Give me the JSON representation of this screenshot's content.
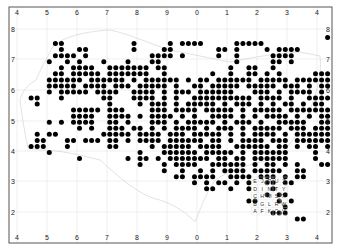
{
  "map": {
    "frame": {
      "x": 9,
      "y": 7,
      "w": 323,
      "h": 236,
      "stroke": "#555555"
    },
    "grid_color": "#dddddd",
    "coast_color": "#bbbbbb",
    "dot_color": "#000000",
    "x_ticks": [
      {
        "label": "4",
        "x": 17
      },
      {
        "label": "5",
        "x": 47
      },
      {
        "label": "6",
        "x": 77
      },
      {
        "label": "7",
        "x": 107
      },
      {
        "label": "8",
        "x": 137
      },
      {
        "label": "9",
        "x": 167
      },
      {
        "label": "0",
        "x": 197
      },
      {
        "label": "1",
        "x": 227
      },
      {
        "label": "2",
        "x": 257
      },
      {
        "label": "3",
        "x": 287
      },
      {
        "label": "4",
        "x": 317
      }
    ],
    "y_ticks": [
      {
        "label": "8",
        "y": 29
      },
      {
        "label": "7",
        "y": 59
      },
      {
        "label": "6",
        "y": 90
      },
      {
        "label": "5",
        "y": 121
      },
      {
        "label": "4",
        "y": 151
      },
      {
        "label": "3",
        "y": 181
      },
      {
        "label": "2",
        "y": 212
      }
    ],
    "dot_grid": {
      "x0": 13,
      "dx": 6.05,
      "y0": 31.5,
      "dy": 6.05,
      "r": 2.5,
      "rows": [
        "..............................................................................................",
        "....................................................#...............................................",
        ".......##...........#.....#.####.....#####.........................................................",
        "........#..##.......#....##.......##.#....#.####....................................................",
        ".......####.#..........####.#.....#..#.....####.....................................................",
        "......#..#.#...#...#...##............#.....##.#..........#####...#......##",
        "........#.####..#######.##..........#..##..#.........##.#####.###..#.###..",
        ".......##.#####.#######..#.......#..#..##.#.#.....####..######.#.....#",
        "......######.######.#.######.#.##.######.#####.###########.##..#.#.#.##...",
        "......#####.####.###.#####.#..##.#####.#####.###.#.##.####...#...#.###.",
        "......#.#####.####..####.#.###.######...###.#.####.#.#.###...#.....##..",
        "...##...#......##...####.#.#..##########.####.#..####.#.####.#..#.#.....",
        "....#...........#....#.###.#.#####.#.###.#.#.##.#.##.####.####..#....",
        "..........#####.###....###.####.#####.#.#####.############.####.#.###",
        "..........####..####.#.####.#.#..####.#.#.####.#.#.####.####.#..###..",
        "......#.#.####..##.#...###.#.#####.#.###.#..#####..####.#.#######.####",
        "...........#.#..###.##.#.#.####.#.###.#.#####.###.####.####.####.###..",
        "....#.##.......#####.####.###.#####.#.#.####.#.######.####.#####.###.",
        "....##...##.###.##.#.####.######.##.#.####.###.#######.#.#.####..#",
        "...###...#......##.....#.#####.####..######.##.#.##.#....#####.##",
        "......#..............#...######.#####.#.######....#...#.#######.",
        "...........#.......#.##.#.#######.##.##.######....#.....##.##..",
        ".....................#...#.####..######.#.##.#.#...###.........",
        ".........................#..#..#.#.####.#####..##...",
        "...........................##.####..####.###.#.##",
        "..............................#.#.##.#.#..##.##..",
        "................................##..#..#...#.....",
        "..........................................#.##......",
        ".......................................##...#.#.....",
        ".............................................#......",
        "...........................................###......",
        "...............................................##..."
      ]
    },
    "key": {
      "x": 255,
      "y": 183,
      "dx": 7.2,
      "dy": 7.6,
      "rows": [
        [
          "E",
          "J",
          "P",
          "U",
          "Z"
        ],
        [
          "D",
          "I",
          "N",
          "T",
          "Y"
        ],
        [
          "C",
          "H",
          "M",
          "S",
          "X"
        ],
        [
          "B",
          "G",
          "L",
          "R",
          "W"
        ],
        [
          "A",
          "F",
          "K",
          "Q",
          "V"
        ]
      ]
    }
  }
}
